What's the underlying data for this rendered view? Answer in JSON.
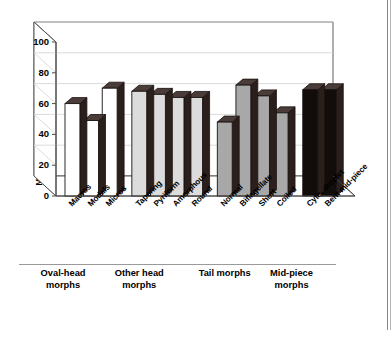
{
  "chart_data": {
    "type": "bar",
    "title": "",
    "xlabel": "",
    "ylabel": "Mean proportion retained by female (%)",
    "ylim": [
      0,
      100
    ],
    "yticks": [
      0,
      20,
      40,
      60,
      80,
      100
    ],
    "grid": true,
    "legend": "none",
    "style": "3d-column",
    "categories": [
      "Macros",
      "Modals",
      "Micros",
      "Tapering",
      "Pyriform",
      "Amorphous",
      "Round",
      "Normal",
      "Biflagellate",
      "Short",
      "Coiled",
      "Cyto. droplet",
      "Bent mid-piece"
    ],
    "values": [
      60,
      49,
      70,
      68,
      66,
      64,
      64,
      48,
      72,
      65,
      54,
      69,
      69
    ],
    "bar_fills": [
      "#ffffff",
      "#ffffff",
      "#ffffff",
      "#dcdcdc",
      "#dcdcdc",
      "#dcdcdc",
      "#dcdcdc",
      "#a8a8a8",
      "#a8a8a8",
      "#a8a8a8",
      "#a8a8a8",
      "#120c0a",
      "#120c0a"
    ],
    "groups": [
      {
        "label": "Oval-head\nmorphs",
        "count": 3
      },
      {
        "label": "Other head\nmorphs",
        "count": 4
      },
      {
        "label": "Tail morphs",
        "count": 4
      },
      {
        "label": "Mid-piece\nmorphs",
        "count": 2
      }
    ]
  },
  "colors": {
    "axis": "#4a4a4a",
    "grid": "#d6d6d6",
    "bar_side": "#2b1f1c",
    "bar_top": "#4a3c38",
    "text": "#000000"
  }
}
